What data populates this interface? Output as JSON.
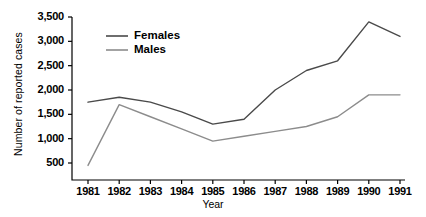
{
  "chart_data": {
    "type": "line",
    "title": "",
    "xlabel": "Year",
    "ylabel": "Number of reported cases",
    "categories": [
      "1981",
      "1982",
      "1983",
      "1984",
      "1985",
      "1986",
      "1987",
      "1988",
      "1989",
      "1990",
      "1991"
    ],
    "x": [
      1981,
      1982,
      1983,
      1984,
      1985,
      1986,
      1987,
      1988,
      1989,
      1990,
      1991
    ],
    "xlim": [
      1981,
      1991
    ],
    "ylim": [
      0,
      3500
    ],
    "yticks": [
      500,
      1000,
      1500,
      2000,
      2500,
      3000,
      3500
    ],
    "ytick_labels": [
      "500",
      "1,000",
      "1,500",
      "2,000",
      "2,500",
      "3,000",
      "3,500"
    ],
    "grid": false,
    "legend_position": "top-left-inside",
    "series": [
      {
        "name": "Females",
        "color": "#4a4a4a",
        "values": [
          1750,
          1850,
          1750,
          1550,
          1300,
          1400,
          2000,
          2400,
          2600,
          3400,
          3100
        ]
      },
      {
        "name": "Males",
        "color": "#8c8c8c",
        "values": [
          450,
          1700,
          1450,
          1200,
          950,
          1050,
          1150,
          1250,
          1450,
          1900,
          1900
        ]
      }
    ]
  },
  "legend": {
    "items": [
      {
        "label": "Females"
      },
      {
        "label": "Males"
      }
    ]
  },
  "axes": {
    "y_axis_title": "Number of reported cases",
    "x_axis_title": "Year"
  }
}
